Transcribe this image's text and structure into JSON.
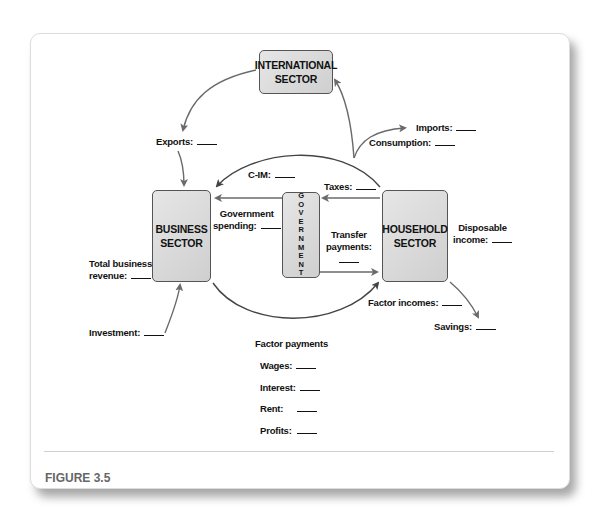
{
  "figure": {
    "caption": "FIGURE 3.5"
  },
  "boxes": {
    "international": "INTERNATIONAL\nSECTOR",
    "business_1": "BUSINESS",
    "business_2": "SECTOR",
    "household_1": "HOUSEHOLD",
    "household_2": "SECTOR",
    "international_1": "INTERNATIONAL",
    "international_2": "SECTOR",
    "government_letters": [
      "G",
      "O",
      "V",
      "E",
      "R",
      "N",
      "M",
      "E",
      "N",
      "T"
    ]
  },
  "labels": {
    "exports": "Exports:",
    "imports": "Imports:",
    "consumption": "Consumption:",
    "c_im": "C-IM:",
    "taxes": "Taxes:",
    "gov_spending_1": "Government",
    "gov_spending_2": "spending:",
    "transfer_1": "Transfer",
    "transfer_2": "payments:",
    "disposable_1": "Disposable",
    "disposable_2": "income:",
    "total_rev_1": "Total business",
    "total_rev_2": "revenue:",
    "factor_incomes": "Factor incomes:",
    "savings": "Savings:",
    "investment": "Investment:"
  },
  "factor_payments": {
    "title": "Factor payments",
    "items": [
      "Wages:",
      "Interest:",
      "Rent:",
      "Profits:"
    ]
  },
  "colors": {
    "arrow": "#666666",
    "dark_arrow": "#444444",
    "box_fill": "#dcdcdc"
  }
}
